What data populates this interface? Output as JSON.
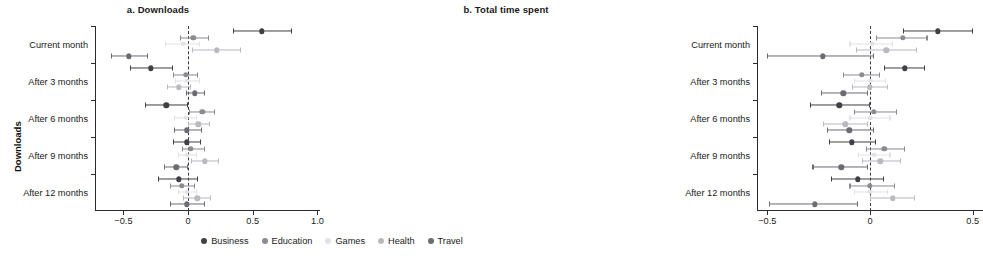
{
  "figure": {
    "panels": [
      {
        "id": "a",
        "title": "a. Downloads",
        "ylabel": "Downloads"
      },
      {
        "id": "b",
        "title": "b. Total time spent",
        "ylabel": "Total time spent"
      }
    ]
  },
  "legend": {
    "position": "bottom-center",
    "entries": [
      {
        "name": "Business",
        "color": "#3f3f46"
      },
      {
        "name": "Education",
        "color": "#8a8a92"
      },
      {
        "name": "Games",
        "color": "#e2e2e6"
      },
      {
        "name": "Health",
        "color": "#b9b9c0"
      },
      {
        "name": "Travel",
        "color": "#6b6b73"
      }
    ]
  },
  "chart_data": [
    {
      "type": "scatter",
      "subtype": "dot-and-whisker coefficient plot",
      "panel": "a",
      "title": "a. Downloads",
      "xlabel": "",
      "ylabel": "Downloads",
      "xlim": [
        -0.72,
        1.02
      ],
      "xticks": [
        -0.5,
        0,
        0.5,
        1.0
      ],
      "xticklabels": [
        "−0.5",
        "0",
        "0.5",
        "1.0"
      ],
      "categories": [
        "Current month",
        "After 3 months",
        "After 6 months",
        "After 9 months",
        "After 12 months"
      ],
      "grid": false,
      "reference_line": 0,
      "reference_line_style": "dashed",
      "series": [
        {
          "name": "Business",
          "color": "#3f3f46",
          "points": [
            {
              "category": "Current month",
              "estimate": 0.57,
              "low": 0.35,
              "high": 0.8
            },
            {
              "category": "After 3 months",
              "estimate": -0.29,
              "low": -0.45,
              "high": -0.12
            },
            {
              "category": "After 6 months",
              "estimate": -0.17,
              "low": -0.33,
              "high": 0.0
            },
            {
              "category": "After 9 months",
              "estimate": -0.01,
              "low": -0.12,
              "high": 0.1
            },
            {
              "category": "After 12 months",
              "estimate": -0.07,
              "low": -0.23,
              "high": 0.08
            }
          ]
        },
        {
          "name": "Education",
          "color": "#8a8a92",
          "points": [
            {
              "category": "Current month",
              "estimate": 0.04,
              "low": -0.06,
              "high": 0.16
            },
            {
              "category": "After 3 months",
              "estimate": -0.02,
              "low": -0.12,
              "high": 0.08
            },
            {
              "category": "After 6 months",
              "estimate": 0.11,
              "low": 0.01,
              "high": 0.21
            },
            {
              "category": "After 9 months",
              "estimate": 0.02,
              "low": -0.05,
              "high": 0.13
            },
            {
              "category": "After 12 months",
              "estimate": -0.05,
              "low": -0.14,
              "high": 0.05
            }
          ]
        },
        {
          "name": "Games",
          "color": "#e2e2e6",
          "points": [
            {
              "category": "Current month",
              "estimate": -0.04,
              "low": -0.18,
              "high": 0.09
            },
            {
              "category": "After 3 months",
              "estimate": -0.01,
              "low": -0.1,
              "high": 0.09
            },
            {
              "category": "After 6 months",
              "estimate": -0.02,
              "low": -0.11,
              "high": 0.07
            },
            {
              "category": "After 9 months",
              "estimate": -0.01,
              "low": -0.08,
              "high": 0.07
            },
            {
              "category": "After 12 months",
              "estimate": -0.01,
              "low": -0.08,
              "high": 0.07
            }
          ]
        },
        {
          "name": "Health",
          "color": "#b9b9c0",
          "points": [
            {
              "category": "Current month",
              "estimate": 0.22,
              "low": 0.03,
              "high": 0.41
            },
            {
              "category": "After 3 months",
              "estimate": -0.07,
              "low": -0.16,
              "high": 0.02
            },
            {
              "category": "After 6 months",
              "estimate": 0.08,
              "low": 0.0,
              "high": 0.17
            },
            {
              "category": "After 9 months",
              "estimate": 0.13,
              "low": 0.02,
              "high": 0.24
            },
            {
              "category": "After 12 months",
              "estimate": 0.07,
              "low": -0.04,
              "high": 0.18
            }
          ]
        },
        {
          "name": "Travel",
          "color": "#6b6b73",
          "points": [
            {
              "category": "Current month",
              "estimate": -0.46,
              "low": -0.6,
              "high": -0.31
            },
            {
              "category": "After 3 months",
              "estimate": 0.05,
              "low": -0.02,
              "high": 0.13
            },
            {
              "category": "After 6 months",
              "estimate": -0.01,
              "low": -0.11,
              "high": 0.11
            },
            {
              "category": "After 9 months",
              "estimate": -0.09,
              "low": -0.19,
              "high": 0.0
            },
            {
              "category": "After 12 months",
              "estimate": -0.01,
              "low": -0.14,
              "high": 0.13
            }
          ]
        }
      ]
    },
    {
      "type": "scatter",
      "subtype": "dot-and-whisker coefficient plot",
      "panel": "b",
      "title": "b. Total time spent",
      "xlabel": "",
      "ylabel": "Total time spent",
      "xlim": [
        -0.55,
        0.55
      ],
      "xticks": [
        -0.5,
        0,
        0.5
      ],
      "xticklabels": [
        "−0.5",
        "0",
        "0.5"
      ],
      "categories": [
        "Current month",
        "After 3 months",
        "After 6 months",
        "After 9 months",
        "After 12 months"
      ],
      "grid": false,
      "reference_line": 0,
      "reference_line_style": "dashed",
      "series": [
        {
          "name": "Business",
          "color": "#3f3f46",
          "points": [
            {
              "category": "Current month",
              "estimate": 0.33,
              "low": 0.16,
              "high": 0.5
            },
            {
              "category": "After 3 months",
              "estimate": 0.17,
              "low": 0.07,
              "high": 0.27
            },
            {
              "category": "After 6 months",
              "estimate": -0.15,
              "low": -0.29,
              "high": 0.0
            },
            {
              "category": "After 9 months",
              "estimate": -0.09,
              "low": -0.2,
              "high": 0.03
            },
            {
              "category": "After 12 months",
              "estimate": -0.06,
              "low": -0.19,
              "high": 0.07
            }
          ]
        },
        {
          "name": "Education",
          "color": "#8a8a92",
          "points": [
            {
              "category": "Current month",
              "estimate": 0.16,
              "low": 0.03,
              "high": 0.28
            },
            {
              "category": "After 3 months",
              "estimate": -0.04,
              "low": -0.13,
              "high": 0.05
            },
            {
              "category": "After 6 months",
              "estimate": 0.02,
              "low": -0.08,
              "high": 0.13
            },
            {
              "category": "After 9 months",
              "estimate": 0.07,
              "low": -0.02,
              "high": 0.17
            },
            {
              "category": "After 12 months",
              "estimate": 0.0,
              "low": -0.1,
              "high": 0.12
            }
          ]
        },
        {
          "name": "Games",
          "color": "#e2e2e6",
          "points": [
            {
              "category": "Current month",
              "estimate": 0.01,
              "low": -0.1,
              "high": 0.11
            },
            {
              "category": "After 3 months",
              "estimate": 0.0,
              "low": -0.08,
              "high": 0.08
            },
            {
              "category": "After 6 months",
              "estimate": 0.0,
              "low": -0.1,
              "high": 0.1
            },
            {
              "category": "After 9 months",
              "estimate": 0.02,
              "low": -0.06,
              "high": 0.1
            },
            {
              "category": "After 12 months",
              "estimate": 0.0,
              "low": -0.08,
              "high": 0.09
            }
          ]
        },
        {
          "name": "Health",
          "color": "#b9b9c0",
          "points": [
            {
              "category": "Current month",
              "estimate": 0.08,
              "low": -0.07,
              "high": 0.23
            },
            {
              "category": "After 3 months",
              "estimate": 0.0,
              "low": -0.09,
              "high": 0.09
            },
            {
              "category": "After 6 months",
              "estimate": -0.12,
              "low": -0.23,
              "high": -0.01
            },
            {
              "category": "After 9 months",
              "estimate": 0.05,
              "low": -0.04,
              "high": 0.15
            },
            {
              "category": "After 12 months",
              "estimate": 0.11,
              "low": 0.0,
              "high": 0.22
            }
          ]
        },
        {
          "name": "Travel",
          "color": "#6b6b73",
          "points": [
            {
              "category": "Current month",
              "estimate": -0.23,
              "low": -0.5,
              "high": 0.02
            },
            {
              "category": "After 3 months",
              "estimate": -0.13,
              "low": -0.24,
              "high": -0.01
            },
            {
              "category": "After 6 months",
              "estimate": -0.1,
              "low": -0.21,
              "high": 0.02
            },
            {
              "category": "After 9 months",
              "estimate": -0.14,
              "low": -0.28,
              "high": -0.01
            },
            {
              "category": "After 12 months",
              "estimate": -0.27,
              "low": -0.49,
              "high": -0.06
            }
          ]
        }
      ]
    }
  ]
}
